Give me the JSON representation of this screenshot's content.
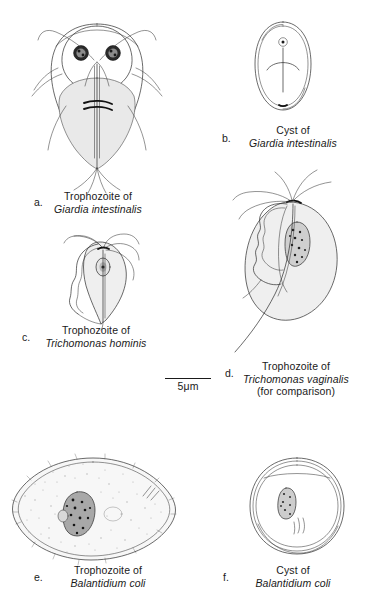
{
  "plate": {
    "title_visible": false,
    "background_color": "#ffffff",
    "ink_color": "#2b2b2b"
  },
  "scale_bar": {
    "label": "5μm",
    "name": "scale-bar"
  },
  "figures": [
    {
      "letter": "a.",
      "caption_roman": "Trophozoite of",
      "caption_italic": "Giardia intestinalis",
      "organism": "giardia-trophozoite"
    },
    {
      "letter": "b.",
      "caption_roman": "Cyst of",
      "caption_italic": "Giardia intestinalis",
      "organism": "giardia-cyst"
    },
    {
      "letter": "c.",
      "caption_roman": "Trophozoite of",
      "caption_italic": "Trichomonas hominis",
      "organism": "trichomonas-hominis-trophozoite"
    },
    {
      "letter": "d.",
      "caption_roman": "Trophozoite of",
      "caption_italic": "Trichomonas vaginalis",
      "caption_note": "(for comparison)",
      "organism": "trichomonas-vaginalis-trophozoite"
    },
    {
      "letter": "e.",
      "caption_roman": "Trophozoite of",
      "caption_italic": "Balantidium coli",
      "organism": "balantidium-trophozoite"
    },
    {
      "letter": "f.",
      "caption_roman": "Cyst of",
      "caption_italic": "Balantidium coli",
      "organism": "balantidium-cyst"
    }
  ]
}
